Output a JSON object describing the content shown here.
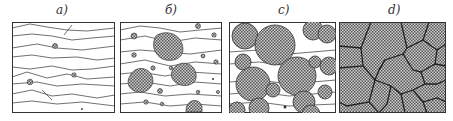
{
  "figure": {
    "panels": [
      {
        "label": "a)",
        "stage": "deformed grains, first nuclei"
      },
      {
        "label": "б)",
        "stage": "nuclei growing"
      },
      {
        "label": "c)",
        "stage": "new grains consuming deformed structure"
      },
      {
        "label": "d)",
        "stage": "fully recrystallized equiaxed grains"
      }
    ]
  },
  "colors": {
    "line": "#333333",
    "background": "#ffffff",
    "hatch_dark": "#555555",
    "hatch_light": "#cfcfcf"
  }
}
